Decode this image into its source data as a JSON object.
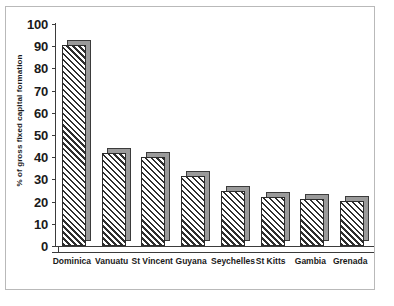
{
  "chart_data": {
    "type": "bar",
    "title": "",
    "subtitle": "",
    "xlabel": "",
    "ylabel": "% of gross fixed capital formation",
    "categories": [
      "Dominica",
      "Vanuatu",
      "St Vincent",
      "Guyana",
      "Seychelles",
      "St Kitts",
      "Gambia",
      "Grenada"
    ],
    "values": [
      90.5,
      42,
      40,
      31.5,
      25,
      22,
      21,
      20.5
    ],
    "ylim": [
      0,
      100
    ],
    "ytick_labels": [
      "100",
      "90",
      "80",
      "70",
      "60",
      "50",
      "40",
      "30",
      "20",
      "10",
      "0"
    ],
    "ytick_values": [
      100,
      90,
      80,
      70,
      60,
      50,
      40,
      30,
      20,
      10,
      0
    ],
    "grid": false,
    "legend": null,
    "series": [
      {
        "name": "% of gross fixed capital formation",
        "values": [
          90.5,
          42,
          40,
          31.5,
          25,
          22,
          21,
          20.5
        ]
      }
    ],
    "style": {
      "bar_fill": "hatched-diagonal",
      "bar_edge_color": "#2b2b2b",
      "bar_depth_color": "#9a9a9a",
      "axis_color": "#3b3b3b",
      "frame_color": "#b9b9b9",
      "background": "#ffffff",
      "text_color": "#1a1a1a"
    }
  }
}
